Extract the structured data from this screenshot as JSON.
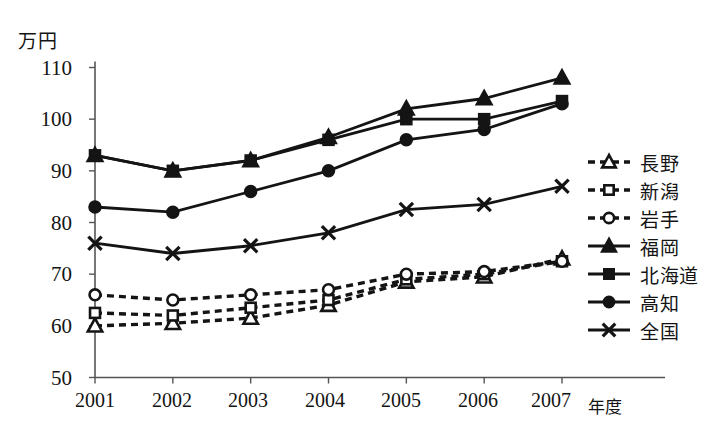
{
  "chart_data": {
    "type": "line",
    "title": "",
    "xlabel": "年度",
    "ylabel": "万円",
    "unit_label": "万円",
    "x_suffix": "年度",
    "categories": [
      "2001",
      "2002",
      "2003",
      "2004",
      "2005",
      "2006",
      "2007"
    ],
    "ylim": [
      50,
      110
    ],
    "yticks": [
      110,
      100,
      90,
      80,
      70,
      60,
      50
    ],
    "grid": false,
    "legend_position": "right",
    "series": [
      {
        "name": "長野",
        "marker": "open-triangle",
        "line": "dashed",
        "values": [
          60,
          60.5,
          61.5,
          64,
          68.5,
          69.5,
          73
        ]
      },
      {
        "name": "新潟",
        "marker": "open-square",
        "line": "dashed",
        "values": [
          62.5,
          62,
          63.5,
          65,
          69,
          70,
          72.5
        ]
      },
      {
        "name": "岩手",
        "marker": "open-circle",
        "line": "dashed",
        "values": [
          66,
          65,
          66,
          67,
          70,
          70.5,
          72.5
        ]
      },
      {
        "name": "福岡",
        "marker": "filled-triangle",
        "line": "solid",
        "values": [
          93,
          90,
          92,
          96.5,
          102,
          104,
          108
        ]
      },
      {
        "name": "北海道",
        "marker": "filled-square",
        "line": "solid",
        "values": [
          93,
          90,
          92,
          96,
          100,
          100,
          103.5
        ]
      },
      {
        "name": "高知",
        "marker": "filled-circle",
        "line": "solid",
        "values": [
          83,
          82,
          86,
          90,
          96,
          98,
          103
        ]
      },
      {
        "name": "全国",
        "marker": "cross-x",
        "line": "solid",
        "values": [
          76,
          74,
          75.5,
          78,
          82.5,
          83.5,
          87
        ]
      }
    ],
    "colors": {
      "ink": "#141414",
      "axis": "#555555",
      "background": "#ffffff"
    }
  }
}
